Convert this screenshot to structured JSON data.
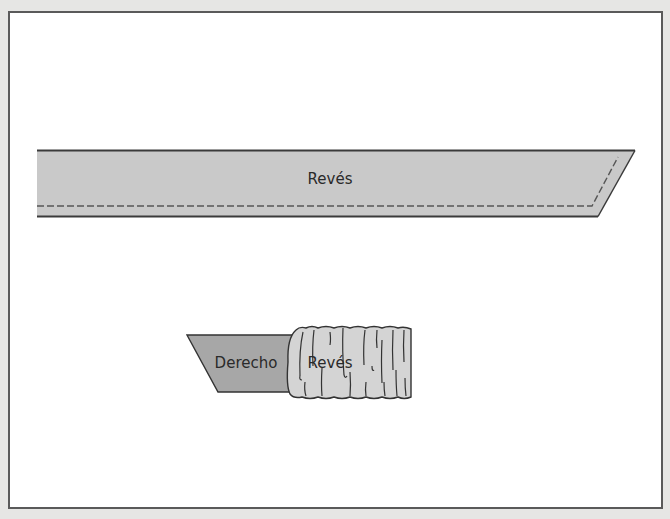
{
  "diagram": {
    "strip": {
      "label": "Revés",
      "fill": "#c9c9c9",
      "stroke": "#3a3a3a",
      "stitch_color": "#555555"
    },
    "ruffle": {
      "flat_part": {
        "label": "Derecho",
        "fill": "#a7a7a7"
      },
      "gathered_part": {
        "label": "Revés",
        "fill": "#d4d4d4"
      },
      "stroke": "#333333"
    },
    "colors": {
      "background": "#e6e6e4",
      "frame_fill": "#ffffff",
      "frame_border": "#5a5a5a"
    }
  }
}
